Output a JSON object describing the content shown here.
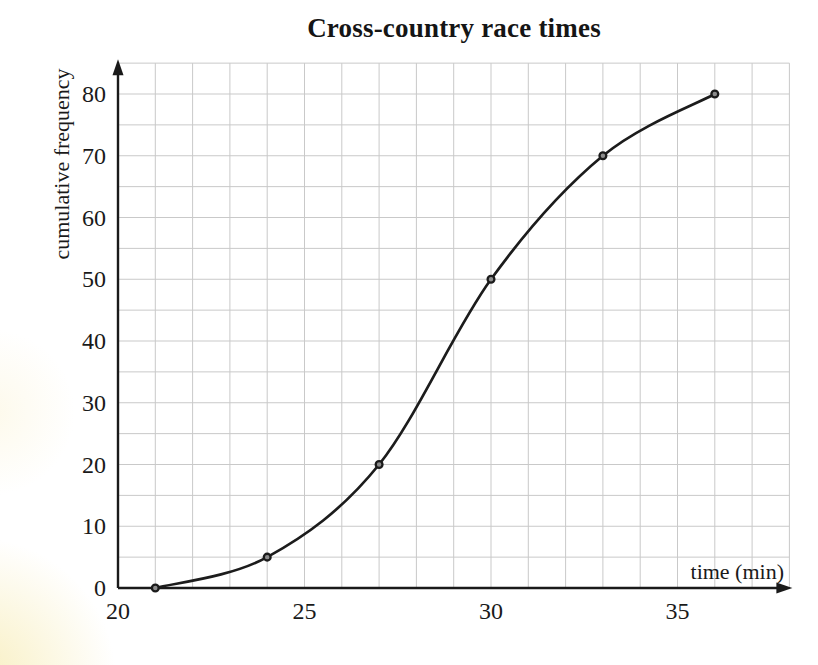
{
  "chart_data": {
    "type": "line",
    "title": "Cross-country race times",
    "xlabel": "time (min)",
    "ylabel": "cumulative frequency",
    "x": [
      21,
      24,
      27,
      30,
      33,
      36
    ],
    "y": [
      0,
      5,
      20,
      50,
      70,
      80
    ],
    "series": [
      {
        "name": "cumulative frequency curve",
        "x": [
          21,
          24,
          27,
          30,
          33,
          36
        ],
        "y": [
          0,
          5,
          20,
          50,
          70,
          80
        ]
      }
    ],
    "xlim": [
      20,
      38
    ],
    "ylim": [
      0,
      85
    ],
    "x_ticks": [
      20,
      25,
      30,
      35
    ],
    "y_ticks": [
      0,
      10,
      20,
      30,
      40,
      50,
      60,
      70,
      80
    ],
    "x_minor_step": 1,
    "y_minor_step": 5,
    "grid": true,
    "curve_style": "smooth",
    "marker": "circle",
    "legend": "none",
    "colors": {
      "line": "#1c1c1c",
      "marker_fill": "#8c8c8c",
      "marker_stroke": "#1b1b1b",
      "grid": "#c9c9c9",
      "axis": "#1a1a1a",
      "text": "#1a1a1a",
      "background": "#ffffff"
    }
  }
}
